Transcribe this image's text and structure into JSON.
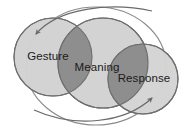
{
  "diagram": {
    "type": "venn-three-circle-overlapping",
    "background_color": "#ffffff",
    "palette": {
      "circle_fill_light": "#d2d2d2",
      "circle_fill_light_alt": "#d7d7d7",
      "overlap_fill_dark": "#8e8e8e",
      "circle_stroke": "#6e6e6e",
      "outer_ring_stroke": "#8a8a8a",
      "arrow_stroke": "#6a6a6a",
      "label_color": "#1a1a1a"
    },
    "circles": [
      {
        "id": "gesture",
        "label": "Gesture",
        "cx": 53,
        "cy": 57,
        "r": 39,
        "fill": "#d2d2d2",
        "stroke": "#6e6e6e",
        "label_x": 48,
        "label_y": 57
      },
      {
        "id": "meaning",
        "label": "Meaning",
        "cx": 103,
        "cy": 63,
        "r": 45,
        "fill": "#d2d2d2",
        "stroke": "#6e6e6e",
        "label_x": 97,
        "label_y": 68
      },
      {
        "id": "response",
        "label": "Response",
        "cx": 143,
        "cy": 79,
        "r": 35,
        "fill": "#d2d2d2",
        "stroke": "#6e6e6e",
        "label_x": 144,
        "label_y": 79
      }
    ],
    "outer_ring": {
      "id": "outer-ring",
      "cx": 96,
      "cy": 66,
      "rx": 70,
      "ry": 59,
      "fill": "none",
      "stroke": "#8a8a8a"
    },
    "arrows": [
      {
        "id": "arrow-to-gesture",
        "direction": "leftward-down",
        "target": "gesture"
      },
      {
        "id": "arrow-to-response",
        "direction": "rightward-up",
        "target": "response"
      }
    ]
  }
}
